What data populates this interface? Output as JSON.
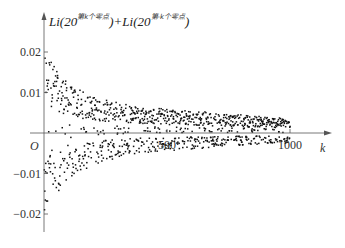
{
  "chart_data": {
    "type": "scatter",
    "title": "",
    "ylabel": "Li(20^{第k个零点})+Li(20^{第-k个零点})",
    "ylabel_parts": {
      "li1": "Li(20",
      "sup1": "第k个零点",
      "mid": ")+Li(20",
      "sup2": "第-k个零点",
      "end": ")"
    },
    "xlabel": "k",
    "origin_label": "O",
    "xlim": [
      0,
      1100
    ],
    "ylim": [
      -0.022,
      0.023
    ],
    "x_ticks": [
      {
        "value": 500,
        "label": "500"
      },
      {
        "value": 1000,
        "label": "1000"
      }
    ],
    "y_ticks": [
      {
        "value": 0.02,
        "label": "0.02"
      },
      {
        "value": 0.01,
        "label": "0.01"
      },
      {
        "value": -0.01,
        "label": "−0.01"
      },
      {
        "value": -0.02,
        "label": "−0.02"
      }
    ],
    "grid": false,
    "legend": null,
    "point_color": "#111111",
    "axis_color": "#555555",
    "envelope": {
      "k": [
        10,
        50,
        100,
        200,
        300,
        400,
        500,
        600,
        700,
        800,
        900,
        1000
      ],
      "upper": [
        0.02,
        0.016,
        0.012,
        0.009,
        0.0075,
        0.0065,
        0.006,
        0.0055,
        0.005,
        0.0045,
        0.004,
        0.0035
      ],
      "lower": [
        -0.019,
        -0.015,
        -0.011,
        -0.008,
        -0.006,
        -0.005,
        -0.0045,
        -0.004,
        -0.0035,
        -0.003,
        -0.0028,
        -0.0025
      ]
    },
    "n_points": 1000
  }
}
